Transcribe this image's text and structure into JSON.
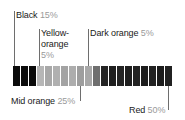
{
  "figure": {
    "type": "color-distribution-strip",
    "background": "#ffffff"
  },
  "callouts": [
    {
      "id": "black",
      "name": "Black",
      "percent": "15%",
      "position": "top-left"
    },
    {
      "id": "yellow-orange",
      "name_line1": "Yellow-",
      "name_line2": "orange",
      "name": "Yellow-orange",
      "percent": "5%",
      "position": "top-middle"
    },
    {
      "id": "dark-orange",
      "name": "Dark orange",
      "percent": "5%",
      "position": "top-right"
    },
    {
      "id": "mid-orange",
      "name": "Mid orange",
      "percent": "25%",
      "position": "bottom-left"
    },
    {
      "id": "red",
      "name": "Red",
      "percent": "50%",
      "position": "bottom-right"
    }
  ],
  "chart_data": {
    "type": "bar",
    "title": "",
    "xlabel": "",
    "ylabel": "",
    "categories": [
      "Black",
      "Yellow-orange",
      "Mid orange",
      "Dark orange",
      "Red"
    ],
    "values": [
      15,
      5,
      25,
      5,
      50
    ],
    "value_labels": [
      "15%",
      "5%",
      "25%",
      "5%",
      "50%"
    ],
    "grid": false,
    "legend": "callouts",
    "segments": [
      {
        "index": 0,
        "group": "Black",
        "color": "#0b0b0b"
      },
      {
        "index": 1,
        "group": "Black",
        "color": "#0b0b0b"
      },
      {
        "index": 2,
        "group": "Black",
        "color": "#0b0b0b"
      },
      {
        "index": 3,
        "group": "Yellow-orange",
        "color": "#b6b6b6"
      },
      {
        "index": 4,
        "group": "Mid orange",
        "color": "#a8a8a8"
      },
      {
        "index": 5,
        "group": "Mid orange",
        "color": "#b0b0b0"
      },
      {
        "index": 6,
        "group": "Mid orange",
        "color": "#a3a3a3"
      },
      {
        "index": 7,
        "group": "Mid orange",
        "color": "#adadad"
      },
      {
        "index": 8,
        "group": "Mid orange",
        "color": "#9e9e9e"
      },
      {
        "index": 9,
        "group": "Mid orange",
        "color": "#a8a8a8"
      },
      {
        "index": 10,
        "group": "Dark orange",
        "color": "#6f6f6f"
      },
      {
        "index": 11,
        "group": "Red",
        "color": "#242424"
      },
      {
        "index": 12,
        "group": "Red",
        "color": "#1f1f1f"
      },
      {
        "index": 13,
        "group": "Red",
        "color": "#242424"
      },
      {
        "index": 14,
        "group": "Red",
        "color": "#1e1e1e"
      },
      {
        "index": 15,
        "group": "Red",
        "color": "#232323"
      },
      {
        "index": 16,
        "group": "Red",
        "color": "#1d1d1d"
      },
      {
        "index": 17,
        "group": "Red",
        "color": "#222222"
      },
      {
        "index": 18,
        "group": "Red",
        "color": "#1c1c1c"
      },
      {
        "index": 19,
        "group": "Red",
        "color": "#212121"
      }
    ]
  }
}
